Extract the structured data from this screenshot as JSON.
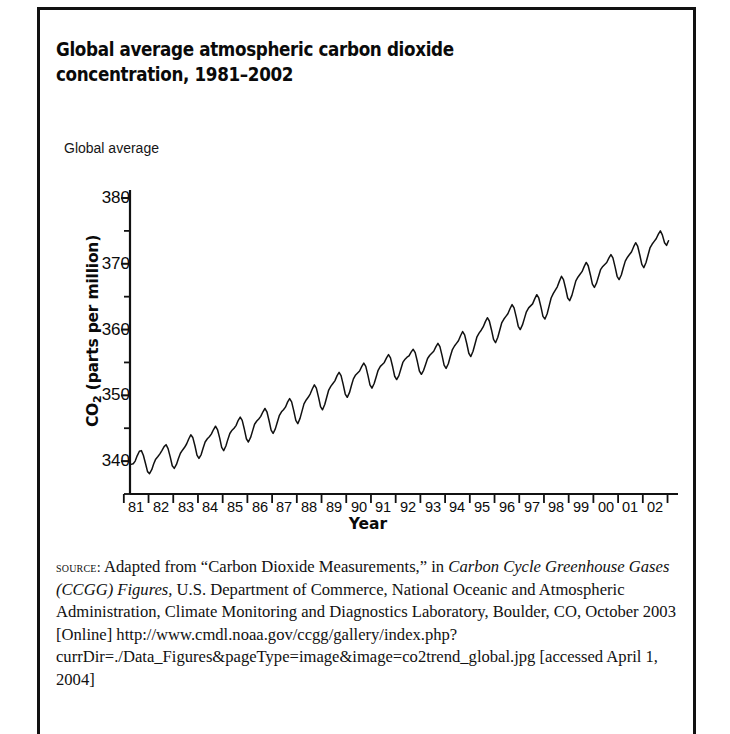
{
  "figure": {
    "title": "Global average atmospheric carbon dioxide concentration, 1981–2002",
    "axis_note": "Global average"
  },
  "chart_data": {
    "type": "line",
    "title": "Global average atmospheric carbon dioxide concentration, 1981–2002",
    "subtitle": "Global average",
    "xlabel": "Year",
    "ylabel": "CO2 (parts per million)",
    "ylabel_html": "CO<sub>2</sub> (parts per million)",
    "xlim": [
      1980.75,
      2002.6
    ],
    "ylim": [
      335,
      380
    ],
    "yticks": [
      340,
      350,
      360,
      370,
      380
    ],
    "yticks_minor": [
      335,
      345,
      355,
      365,
      375
    ],
    "xtick_labels": [
      "81",
      "82",
      "83",
      "84",
      "85",
      "86",
      "87",
      "88",
      "89",
      "90",
      "91",
      "92",
      "93",
      "94",
      "95",
      "96",
      "97",
      "98",
      "99",
      "00",
      "01",
      "02"
    ],
    "xtick_values": [
      1981,
      1982,
      1983,
      1984,
      1985,
      1986,
      1987,
      1988,
      1989,
      1990,
      1991,
      1992,
      1993,
      1994,
      1995,
      1996,
      1997,
      1998,
      1999,
      2000,
      2001,
      2002
    ],
    "grid": false,
    "legend": false,
    "line_color": "#111111",
    "series": [
      {
        "name": "Global average CO2 (ppm)",
        "annual_mean": [
          339.8,
          340.5,
          342.2,
          343.5,
          344.8,
          346.0,
          347.4,
          349.3,
          351.2,
          352.6,
          353.9,
          354.6,
          355.6,
          356.9,
          358.5,
          360.3,
          361.9,
          363.9,
          365.9,
          367.2,
          368.8,
          370.9
        ],
        "seasonal_amplitude_ppm": 2.6,
        "end_value": 373.5,
        "start_value": 339.5,
        "x": [
          1980.79,
          1980.88,
          1980.96,
          1981.04,
          1981.13,
          1981.21,
          1981.29,
          1981.38,
          1981.46,
          1981.54,
          1981.63,
          1981.71,
          1981.79,
          1981.88,
          1981.96,
          1982.04,
          1982.13,
          1982.21,
          1982.29,
          1982.38,
          1982.46,
          1982.54,
          1982.63,
          1982.71,
          1982.79,
          1982.88,
          1982.96,
          1983.04,
          1983.13,
          1983.21,
          1983.29,
          1983.38,
          1983.46,
          1983.54,
          1983.63,
          1983.71,
          1983.79,
          1983.88,
          1983.96,
          1984.04,
          1984.13,
          1984.21,
          1984.29,
          1984.38,
          1984.46,
          1984.54,
          1984.63,
          1984.71,
          1984.79,
          1984.88,
          1984.96,
          1985.04,
          1985.13,
          1985.21,
          1985.29,
          1985.38,
          1985.46,
          1985.54,
          1985.63,
          1985.71,
          1985.79,
          1985.88,
          1985.96,
          1986.04,
          1986.13,
          1986.21,
          1986.29,
          1986.38,
          1986.46,
          1986.54,
          1986.63,
          1986.71,
          1986.79,
          1986.88,
          1986.96,
          1987.04,
          1987.13,
          1987.21,
          1987.29,
          1987.38,
          1987.46,
          1987.54,
          1987.63,
          1987.71,
          1987.79,
          1987.88,
          1987.96,
          1988.04,
          1988.13,
          1988.21,
          1988.29,
          1988.38,
          1988.46,
          1988.54,
          1988.63,
          1988.71,
          1988.79,
          1988.88,
          1988.96,
          1989.04,
          1989.13,
          1989.21,
          1989.29,
          1989.38,
          1989.46,
          1989.54,
          1989.63,
          1989.71,
          1989.79,
          1989.88,
          1989.96,
          1990.04,
          1990.13,
          1990.21,
          1990.29,
          1990.38,
          1990.46,
          1990.54,
          1990.63,
          1990.71,
          1990.79,
          1990.88,
          1990.96,
          1991.04,
          1991.13,
          1991.21,
          1991.29,
          1991.38,
          1991.46,
          1991.54,
          1991.63,
          1991.71,
          1991.79,
          1991.88,
          1991.96,
          1992.04,
          1992.13,
          1992.21,
          1992.29,
          1992.38,
          1992.46,
          1992.54,
          1992.63,
          1992.71,
          1992.79,
          1992.88,
          1992.96,
          1993.04,
          1993.13,
          1993.21,
          1993.29,
          1993.38,
          1993.46,
          1993.54,
          1993.63,
          1993.71,
          1993.79,
          1993.88,
          1993.96,
          1994.04,
          1994.13,
          1994.21,
          1994.29,
          1994.38,
          1994.46,
          1994.54,
          1994.63,
          1994.71,
          1994.79,
          1994.88,
          1994.96,
          1995.04,
          1995.13,
          1995.21,
          1995.29,
          1995.38,
          1995.46,
          1995.54,
          1995.63,
          1995.71,
          1995.79,
          1995.88,
          1995.96,
          1996.04,
          1996.13,
          1996.21,
          1996.29,
          1996.38,
          1996.46,
          1996.54,
          1996.63,
          1996.71,
          1996.79,
          1996.88,
          1996.96,
          1997.04,
          1997.13,
          1997.21,
          1997.29,
          1997.38,
          1997.46,
          1997.54,
          1997.63,
          1997.71,
          1997.79,
          1997.88,
          1997.96,
          1998.04,
          1998.13,
          1998.21,
          1998.29,
          1998.38,
          1998.46,
          1998.54,
          1998.63,
          1998.71,
          1998.79,
          1998.88,
          1998.96,
          1999.04,
          1999.13,
          1999.21,
          1999.29,
          1999.38,
          1999.46,
          1999.54,
          1999.63,
          1999.71,
          1999.79,
          1999.88,
          1999.96,
          2000.04,
          2000.13,
          2000.21,
          2000.29,
          2000.38,
          2000.46,
          2000.54,
          2000.63,
          2000.71,
          2000.79,
          2000.88,
          2000.96,
          2001.04,
          2001.13,
          2001.21,
          2001.29,
          2001.38,
          2001.46,
          2001.54,
          2001.63,
          2001.71,
          2001.79,
          2001.88,
          2001.96,
          2002.04,
          2002.13,
          2002.21,
          2002.29,
          2002.38,
          2002.46,
          2002.54
        ],
        "y": [
          339.5,
          339.6,
          340.0,
          340.8,
          341.5,
          341.6,
          340.9,
          339.6,
          338.4,
          338.1,
          338.7,
          339.6,
          340.3,
          340.7,
          341.1,
          341.6,
          342.2,
          342.5,
          341.9,
          340.6,
          339.3,
          338.9,
          339.5,
          340.4,
          341.2,
          341.7,
          342.1,
          342.6,
          343.4,
          344.0,
          343.6,
          342.3,
          340.9,
          340.4,
          341.0,
          342.0,
          342.9,
          343.4,
          343.7,
          344.1,
          344.8,
          345.3,
          344.8,
          343.5,
          342.1,
          341.6,
          342.3,
          343.3,
          344.2,
          344.7,
          345.0,
          345.4,
          346.2,
          346.7,
          346.2,
          344.8,
          343.4,
          342.9,
          343.6,
          344.6,
          345.6,
          346.1,
          346.4,
          346.8,
          347.5,
          348.0,
          347.5,
          346.1,
          344.7,
          344.2,
          344.9,
          345.9,
          346.9,
          347.5,
          347.8,
          348.2,
          349.0,
          349.5,
          349.0,
          347.6,
          346.2,
          345.7,
          346.5,
          347.6,
          348.7,
          349.3,
          349.7,
          350.2,
          351.0,
          351.6,
          351.1,
          349.7,
          348.3,
          347.8,
          348.6,
          349.7,
          350.8,
          351.4,
          351.8,
          352.2,
          353.0,
          353.5,
          353.0,
          351.6,
          350.2,
          349.7,
          350.4,
          351.5,
          352.5,
          353.1,
          353.4,
          353.7,
          354.4,
          354.9,
          354.4,
          353.0,
          351.6,
          351.1,
          351.8,
          352.8,
          353.8,
          354.4,
          354.7,
          355.0,
          355.7,
          356.2,
          355.7,
          354.3,
          352.9,
          352.4,
          353.0,
          354.0,
          355.0,
          355.5,
          355.8,
          356.0,
          356.6,
          357.0,
          356.5,
          355.1,
          353.7,
          353.2,
          353.8,
          354.7,
          355.6,
          356.1,
          356.4,
          356.7,
          357.4,
          357.9,
          357.4,
          356.0,
          354.6,
          354.1,
          354.8,
          355.9,
          356.9,
          357.5,
          357.9,
          358.3,
          359.1,
          359.7,
          359.2,
          357.8,
          356.4,
          355.9,
          356.7,
          357.8,
          358.9,
          359.5,
          359.9,
          360.4,
          361.2,
          361.8,
          361.3,
          359.9,
          358.5,
          358.0,
          358.8,
          359.9,
          361.0,
          361.6,
          362.0,
          362.4,
          363.2,
          363.8,
          363.3,
          361.9,
          360.5,
          360.0,
          360.7,
          361.7,
          362.7,
          363.3,
          363.6,
          363.9,
          364.7,
          365.3,
          364.8,
          363.4,
          362.0,
          361.6,
          362.4,
          363.6,
          364.8,
          365.5,
          366.0,
          366.5,
          367.4,
          368.1,
          367.6,
          366.2,
          364.8,
          364.4,
          365.2,
          366.3,
          367.4,
          368.0,
          368.4,
          368.8,
          369.6,
          370.2,
          369.7,
          368.3,
          366.9,
          366.4,
          367.1,
          368.1,
          369.1,
          369.6,
          369.9,
          370.2,
          370.9,
          371.4,
          370.9,
          369.5,
          368.1,
          367.6,
          368.3,
          369.4,
          370.4,
          371.0,
          371.4,
          371.8,
          372.6,
          373.2,
          372.7,
          371.3,
          369.9,
          369.4,
          370.2,
          371.3,
          372.4,
          373.0,
          373.4,
          373.8,
          374.5,
          375.0,
          374.4,
          373.2,
          372.8,
          373.5
        ]
      }
    ]
  },
  "source": {
    "label": "source:",
    "line1_pre": " Adapted from “Carbon Dioxide Measurements,” in ",
    "italic1": "Carbon Cycle Greenhouse Gases (CCGG) Figures,",
    "line1_post": " U.S. Department of Commerce, National Oceanic and Atmospheric Administration, Climate Monitoring and Diagnostics Laboratory, Boulder, CO, October 2003 [Online] http://www.cmdl.noaa.gov/ccgg/gallery/index.php?currDir=./Data_Figures&pageType=image&image=co2trend_global.jpg [accessed April 1, 2004]"
  }
}
